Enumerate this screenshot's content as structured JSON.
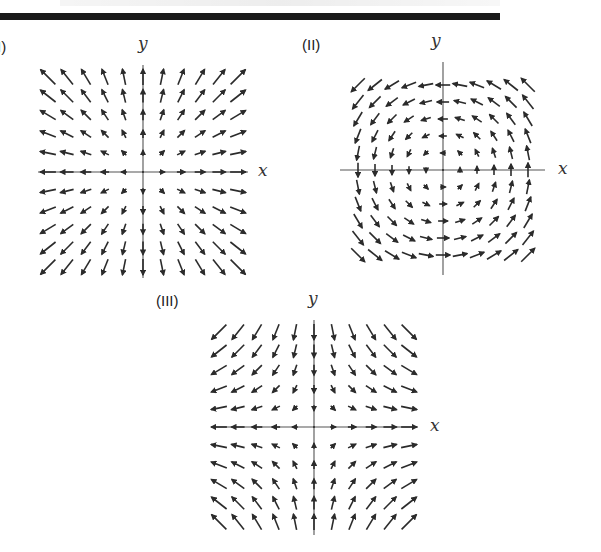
{
  "diagram": {
    "type": "vector_field_panels",
    "panels": [
      {
        "id": "I",
        "label": "(I)",
        "x_axis_label": "x",
        "y_axis_label": "y",
        "field": "radial_outward",
        "formula": "F(x,y) = (x, y)",
        "origin": [
          143,
          172
        ],
        "spacing": 19,
        "grid_range": [
          -5,
          5
        ],
        "x_axis_extent": [
          38,
          248
        ],
        "y_axis_extent": [
          65,
          278
        ],
        "label_pos": [
          -8,
          38
        ],
        "y_label_pos": [
          138,
          33
        ],
        "x_label_pos": [
          258,
          160
        ]
      },
      {
        "id": "II",
        "label": "(II)",
        "x_axis_label": "x",
        "y_axis_label": "y",
        "field": "rotation_counterclockwise",
        "formula": "F(x,y) = (-y, x)",
        "origin": [
          443,
          170
        ],
        "spacing": 17,
        "grid_range": [
          -5,
          5
        ],
        "x_axis_extent": [
          340,
          545
        ],
        "y_axis_extent": [
          62,
          275
        ],
        "label_pos": [
          302,
          36
        ],
        "y_label_pos": [
          431,
          30
        ],
        "x_label_pos": [
          558,
          158
        ]
      },
      {
        "id": "III",
        "label": "(III)",
        "x_axis_label": "x",
        "y_axis_label": "y",
        "field": "saddle",
        "formula": "F(x,y) = (x, -y)",
        "origin": [
          314,
          427
        ],
        "spacing": 19,
        "grid_range": [
          -5,
          5
        ],
        "x_axis_extent": [
          212,
          418
        ],
        "y_axis_extent": [
          320,
          535
        ],
        "label_pos": [
          156,
          292
        ],
        "y_label_pos": [
          308,
          288
        ],
        "x_label_pos": [
          430,
          415
        ]
      }
    ],
    "colors": {
      "arrow": "#2b2b2b",
      "axis": "#555555",
      "rule": "#1a1a1a"
    }
  }
}
